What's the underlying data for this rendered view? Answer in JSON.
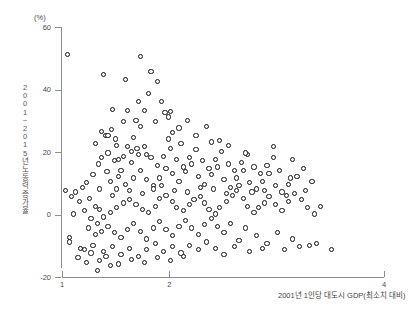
{
  "chart_data": {
    "type": "scatter",
    "title": "",
    "subtitle": "",
    "unit_label": "(%)",
    "xlabel": "2001년 1인당 대도시 GDP(최소치 대비)",
    "ylabel": "2001~2015년 노동력 증가율",
    "ylabel_chars": [
      "2",
      "0",
      "0",
      "1",
      "~",
      "2",
      "0",
      "1",
      "5",
      "년",
      "노",
      "동",
      "력",
      "증",
      "가",
      "율"
    ],
    "xlim": [
      1,
      4
    ],
    "ylim": [
      -20,
      60
    ],
    "xticks": [
      1,
      2,
      4
    ],
    "xtick_labels": [
      "1",
      "2",
      "4"
    ],
    "yticks": [
      -20,
      0,
      20,
      40,
      60
    ],
    "ytick_labels": [
      "-20",
      "0",
      "20",
      "40",
      "60"
    ],
    "grid": false,
    "legend": null,
    "marker": "open-circle",
    "marker_color": "#111111",
    "marker_fill": "#ffffff",
    "n_points": 232,
    "points": [
      [
        1.02,
        8.0
      ],
      [
        1.04,
        51.5
      ],
      [
        1.38,
        45.0
      ],
      [
        1.72,
        51.0
      ],
      [
        1.58,
        43.5
      ],
      [
        1.3,
        23.0
      ],
      [
        1.4,
        25.5
      ],
      [
        1.42,
        25.7
      ],
      [
        1.46,
        34.0
      ],
      [
        1.6,
        33.5
      ],
      [
        1.45,
        27.5
      ],
      [
        1.36,
        27.0
      ],
      [
        1.49,
        24.5
      ],
      [
        1.8,
        39.0
      ],
      [
        1.88,
        43.0
      ],
      [
        1.82,
        46.0
      ],
      [
        1.76,
        33.5
      ],
      [
        1.92,
        36.5
      ],
      [
        1.95,
        33.0
      ],
      [
        2.0,
        33.2
      ],
      [
        1.98,
        31.5
      ],
      [
        2.08,
        28.0
      ],
      [
        1.68,
        30.5
      ],
      [
        1.72,
        28.5
      ],
      [
        1.86,
        30.0
      ],
      [
        2.02,
        26.5
      ],
      [
        1.78,
        19.5
      ],
      [
        1.69,
        21.5
      ],
      [
        1.6,
        22.0
      ],
      [
        1.64,
        20.5
      ],
      [
        1.52,
        18.0
      ],
      [
        1.48,
        17.5
      ],
      [
        1.41,
        14.0
      ],
      [
        1.33,
        16.5
      ],
      [
        1.28,
        13.0
      ],
      [
        1.22,
        10.5
      ],
      [
        1.18,
        9.0
      ],
      [
        1.12,
        7.5
      ],
      [
        1.08,
        6.0
      ],
      [
        1.15,
        4.5
      ],
      [
        1.25,
        5.5
      ],
      [
        1.3,
        3.0
      ],
      [
        1.34,
        2.0
      ],
      [
        1.2,
        1.5
      ],
      [
        1.1,
        0.5
      ],
      [
        1.26,
        -1.0
      ],
      [
        1.32,
        -2.5
      ],
      [
        1.38,
        -0.5
      ],
      [
        1.44,
        1.0
      ],
      [
        1.5,
        2.5
      ],
      [
        1.56,
        4.0
      ],
      [
        1.62,
        5.0
      ],
      [
        1.68,
        3.5
      ],
      [
        1.74,
        2.0
      ],
      [
        1.8,
        1.0
      ],
      [
        1.86,
        3.0
      ],
      [
        1.9,
        5.5
      ],
      [
        1.96,
        6.5
      ],
      [
        2.02,
        4.5
      ],
      [
        2.06,
        2.5
      ],
      [
        2.12,
        1.5
      ],
      [
        2.18,
        3.5
      ],
      [
        2.22,
        5.0
      ],
      [
        2.28,
        6.0
      ],
      [
        2.32,
        4.0
      ],
      [
        2.36,
        2.0
      ],
      [
        2.42,
        0.5
      ],
      [
        2.46,
        2.5
      ],
      [
        2.52,
        4.5
      ],
      [
        2.58,
        6.5
      ],
      [
        2.62,
        8.0
      ],
      [
        2.68,
        5.5
      ],
      [
        2.72,
        3.0
      ],
      [
        2.78,
        1.0
      ],
      [
        2.82,
        2.5
      ],
      [
        2.88,
        4.0
      ],
      [
        2.92,
        6.0
      ],
      [
        2.98,
        3.5
      ],
      [
        3.04,
        1.5
      ],
      [
        3.1,
        4.5
      ],
      [
        3.16,
        7.0
      ],
      [
        3.22,
        5.0
      ],
      [
        3.28,
        2.5
      ],
      [
        3.34,
        0.5
      ],
      [
        3.4,
        3.0
      ],
      [
        1.44,
        11.0
      ],
      [
        1.52,
        12.5
      ],
      [
        1.58,
        10.0
      ],
      [
        1.66,
        12.0
      ],
      [
        1.72,
        14.5
      ],
      [
        1.78,
        11.5
      ],
      [
        1.84,
        9.5
      ],
      [
        1.9,
        12.0
      ],
      [
        1.96,
        15.0
      ],
      [
        2.02,
        13.5
      ],
      [
        2.08,
        11.0
      ],
      [
        2.14,
        14.0
      ],
      [
        2.2,
        16.5
      ],
      [
        2.26,
        12.5
      ],
      [
        2.32,
        10.0
      ],
      [
        2.38,
        13.0
      ],
      [
        2.44,
        15.5
      ],
      [
        2.5,
        11.5
      ],
      [
        2.56,
        9.0
      ],
      [
        2.62,
        12.0
      ],
      [
        2.68,
        14.5
      ],
      [
        2.74,
        10.5
      ],
      [
        2.8,
        8.5
      ],
      [
        2.86,
        11.0
      ],
      [
        2.92,
        13.5
      ],
      [
        2.98,
        9.5
      ],
      [
        3.04,
        7.5
      ],
      [
        3.1,
        10.0
      ],
      [
        3.18,
        12.5
      ],
      [
        3.26,
        8.0
      ],
      [
        1.36,
        18.5
      ],
      [
        1.42,
        20.0
      ],
      [
        1.5,
        22.5
      ],
      [
        1.56,
        19.0
      ],
      [
        1.64,
        17.0
      ],
      [
        1.7,
        19.5
      ],
      [
        1.76,
        22.0
      ],
      [
        1.82,
        18.5
      ],
      [
        1.88,
        16.0
      ],
      [
        1.94,
        19.0
      ],
      [
        2.0,
        21.5
      ],
      [
        2.06,
        18.0
      ],
      [
        2.12,
        15.5
      ],
      [
        2.18,
        18.5
      ],
      [
        2.24,
        21.0
      ],
      [
        2.3,
        17.5
      ],
      [
        2.36,
        15.0
      ],
      [
        2.42,
        18.0
      ],
      [
        2.48,
        20.5
      ],
      [
        2.54,
        16.5
      ],
      [
        2.6,
        14.5
      ],
      [
        2.66,
        17.0
      ],
      [
        2.72,
        19.5
      ],
      [
        2.78,
        15.5
      ],
      [
        2.84,
        13.5
      ],
      [
        2.9,
        16.0
      ],
      [
        2.96,
        18.5
      ],
      [
        3.02,
        14.5
      ],
      [
        3.12,
        12.0
      ],
      [
        3.24,
        15.0
      ],
      [
        1.24,
        -4.0
      ],
      [
        1.3,
        -6.0
      ],
      [
        1.36,
        -5.0
      ],
      [
        1.42,
        -3.5
      ],
      [
        1.48,
        -5.5
      ],
      [
        1.54,
        -7.0
      ],
      [
        1.6,
        -4.5
      ],
      [
        1.66,
        -2.5
      ],
      [
        1.72,
        -5.0
      ],
      [
        1.78,
        -7.5
      ],
      [
        1.84,
        -4.0
      ],
      [
        1.9,
        -2.0
      ],
      [
        1.96,
        -4.5
      ],
      [
        2.02,
        -6.5
      ],
      [
        2.08,
        -3.5
      ],
      [
        2.14,
        -1.5
      ],
      [
        2.2,
        -4.0
      ],
      [
        2.26,
        -6.0
      ],
      [
        2.32,
        -3.0
      ],
      [
        2.38,
        -1.0
      ],
      [
        2.44,
        -3.5
      ],
      [
        2.5,
        -5.5
      ],
      [
        2.56,
        -2.5
      ],
      [
        2.64,
        -8.0
      ],
      [
        2.7,
        -4.0
      ],
      [
        2.8,
        -6.5
      ],
      [
        2.9,
        -9.0
      ],
      [
        3.0,
        -5.5
      ],
      [
        3.14,
        -7.5
      ],
      [
        3.3,
        -9.5
      ],
      [
        1.06,
        -7.0
      ],
      [
        1.06,
        -8.5
      ],
      [
        1.16,
        -10.5
      ],
      [
        1.26,
        -12.0
      ],
      [
        1.34,
        -14.5
      ],
      [
        1.44,
        -16.0
      ],
      [
        1.2,
        -11.0
      ],
      [
        1.28,
        -9.5
      ],
      [
        1.38,
        -11.5
      ],
      [
        1.46,
        -10.0
      ],
      [
        1.54,
        -12.5
      ],
      [
        1.62,
        -10.5
      ],
      [
        1.7,
        -13.0
      ],
      [
        1.78,
        -11.0
      ],
      [
        1.86,
        -9.0
      ],
      [
        1.94,
        -11.5
      ],
      [
        2.02,
        -10.0
      ],
      [
        2.1,
        -12.0
      ],
      [
        2.18,
        -9.5
      ],
      [
        2.26,
        -11.0
      ],
      [
        2.34,
        -8.5
      ],
      [
        2.42,
        -10.5
      ],
      [
        2.5,
        -12.5
      ],
      [
        2.6,
        -10.0
      ],
      [
        2.74,
        -11.5
      ],
      [
        2.86,
        -10.5
      ],
      [
        3.06,
        -11.0
      ],
      [
        3.2,
        -10.0
      ],
      [
        3.36,
        -9.0
      ],
      [
        3.5,
        -11.0
      ],
      [
        1.56,
        30.0
      ],
      [
        1.5,
        8.5
      ],
      [
        1.62,
        8.0
      ],
      [
        1.74,
        7.0
      ],
      [
        1.84,
        8.5
      ],
      [
        1.92,
        9.5
      ],
      [
        2.04,
        8.0
      ],
      [
        2.16,
        7.5
      ],
      [
        2.28,
        9.0
      ],
      [
        2.4,
        8.5
      ],
      [
        2.52,
        7.0
      ],
      [
        2.64,
        9.5
      ],
      [
        2.76,
        7.5
      ],
      [
        2.88,
        8.0
      ],
      [
        3.08,
        6.5
      ],
      [
        1.14,
        -13.5
      ],
      [
        1.22,
        -15.0
      ],
      [
        1.32,
        -17.5
      ],
      [
        1.4,
        -13.0
      ],
      [
        1.52,
        -15.5
      ],
      [
        1.64,
        -14.0
      ],
      [
        1.76,
        -15.0
      ],
      [
        1.88,
        -13.5
      ],
      [
        2.0,
        -14.5
      ],
      [
        2.12,
        -13.0
      ],
      [
        1.66,
        25.0
      ],
      [
        1.54,
        14.5
      ],
      [
        1.46,
        6.5
      ],
      [
        1.34,
        8.5
      ],
      [
        2.46,
        24.0
      ],
      [
        2.54,
        22.5
      ],
      [
        2.7,
        20.0
      ],
      [
        2.96,
        22.0
      ],
      [
        3.14,
        18.0
      ],
      [
        3.32,
        11.0
      ],
      [
        1.98,
        24.5
      ],
      [
        2.1,
        23.0
      ],
      [
        2.24,
        25.5
      ],
      [
        2.38,
        23.5
      ],
      [
        1.7,
        36.5
      ],
      [
        2.16,
        30.5
      ],
      [
        2.34,
        28.5
      ]
    ]
  }
}
